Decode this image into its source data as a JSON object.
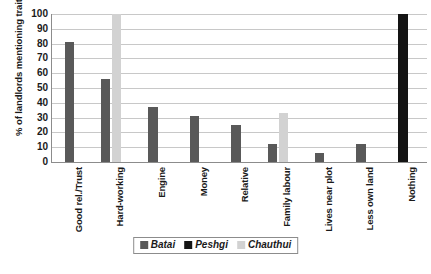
{
  "chart_data": {
    "type": "bar",
    "title": "",
    "subtitle": "",
    "xlabel": "",
    "ylabel": "% of landlords mentioning trait",
    "ylim": [
      0,
      100
    ],
    "yticks": [
      0,
      10,
      20,
      30,
      40,
      50,
      60,
      70,
      80,
      90,
      100
    ],
    "grid": true,
    "legend_position": "bottom",
    "categories": [
      "Good rel./Trust",
      "Hard-working",
      "Engine",
      "Money",
      "Relative",
      "Family labour",
      "Lives near plot",
      "Less own land",
      "Nothing"
    ],
    "series": [
      {
        "name": "Batai",
        "color": "#595959",
        "values": [
          81,
          56,
          37,
          31,
          25,
          12.5,
          6,
          12.5,
          0
        ]
      },
      {
        "name": "Peshgi",
        "color": "#141414",
        "values": [
          0,
          0,
          0,
          0,
          0,
          0,
          0,
          0,
          100
        ]
      },
      {
        "name": "Chauthui",
        "color": "#d2d2d2",
        "values": [
          0,
          100,
          0,
          0,
          0,
          33,
          0,
          0,
          0
        ]
      }
    ]
  },
  "axis": {
    "y_title": "% of landlords mentioning trait",
    "y_tick_labels": [
      "0",
      "10",
      "20",
      "30",
      "40",
      "50",
      "60",
      "70",
      "80",
      "90",
      "100"
    ],
    "x_tick_labels": [
      "Good rel./Trust",
      "Hard-working",
      "Engine",
      "Money",
      "Relative",
      "Family labour",
      "Lives near plot",
      "Less own land",
      "Nothing"
    ]
  },
  "legend": {
    "items": [
      {
        "label": "Batai",
        "color": "#595959"
      },
      {
        "label": "Peshgi",
        "color": "#141414"
      },
      {
        "label": "Chauthui",
        "color": "#d2d2d2"
      }
    ]
  },
  "colors": {
    "axis_line": "#8c8c8c",
    "gridline": "#c8c8c8",
    "text": "#1a1a1a",
    "background": "#ffffff"
  }
}
